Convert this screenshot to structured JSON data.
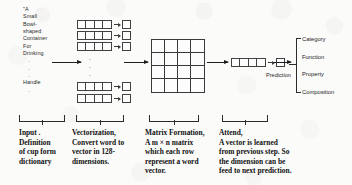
{
  "figure": {
    "background_color": "#fbfbfa",
    "ink_color": "#1b1b1b"
  },
  "input_definition": {
    "name": "cup-definition-text",
    "lines": [
      "\"A",
      "Small",
      "Bowl-",
      "shaped",
      "Container",
      "For",
      "Drinking"
    ],
    "ellipsis_1": ".",
    "ellipsis_2": ".",
    "ellipsis_3": ".",
    "tail_word": "Handle",
    "ellipsis_4": "."
  },
  "arrows": {
    "input_to_vectorization": "arrow-right",
    "vectorization_to_matrix": "arrow-right",
    "matrix_to_attend": "arrow-right",
    "attend_to_prediction": "arrow-right"
  },
  "vectorization": {
    "name": "word-vector-stack",
    "cells_per_vector": 4,
    "rows_top": 3,
    "rows_bottom": 2,
    "vertical_ellipsis": "."
  },
  "matrix": {
    "name": "word-matrix",
    "rows": 4,
    "cols": 4
  },
  "attend": {
    "name": "attention-vector",
    "cells": 4,
    "prediction_label": "Prediction"
  },
  "outputs": {
    "name": "prediction-categories",
    "items": [
      "Category",
      "Function",
      "Property",
      "Composition"
    ]
  },
  "captions": [
    {
      "key": "input",
      "lines": [
        "Input .",
        "Definition",
        "of cup form",
        "dictionary"
      ]
    },
    {
      "key": "vectorization",
      "lines": [
        "Vectorization,",
        "Convert word to",
        "vector in 128-",
        "dimensions."
      ]
    },
    {
      "key": "matrix_formation",
      "lines": [
        "Matrix Formation,",
        "A m × n matrix",
        "which each row",
        "represent a word",
        "vector."
      ]
    },
    {
      "key": "attend",
      "lines": [
        "Attend,",
        "A vector is learned",
        "from previous step. So",
        "the dimension can be",
        "feed to next prediction."
      ]
    }
  ]
}
